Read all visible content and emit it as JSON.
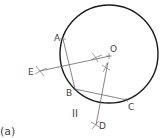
{
  "figure_label": "(a)",
  "region_label": "II",
  "points": {
    "A": "A",
    "B": "B",
    "C": "C",
    "D": "D",
    "E": "E",
    "O": "O"
  },
  "colors": {
    "circle": "#1a1a1a",
    "lines": "#555555",
    "text": "#444444"
  }
}
